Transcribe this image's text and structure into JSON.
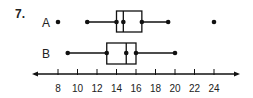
{
  "problem_number": "7.",
  "chart_data": {
    "type": "boxplot",
    "title": "",
    "xlabel": "",
    "ylabel": "",
    "orientation": "horizontal",
    "axis": {
      "min": 6,
      "max": 26.5,
      "ticks": [
        8,
        10,
        12,
        14,
        16,
        18,
        20,
        22,
        24
      ],
      "tick_labels": [
        "8",
        "10",
        "12",
        "14",
        "16",
        "18",
        "20",
        "22",
        "24"
      ],
      "arrows_both_ends": true
    },
    "series": [
      {
        "name": "A",
        "whisker_low": 11,
        "q1": 14,
        "median": 14.7,
        "q3": 16.6,
        "whisker_high": 19.3,
        "outliers": [
          8,
          24
        ]
      },
      {
        "name": "B",
        "whisker_low": 9,
        "q1": 13,
        "median": 15,
        "q3": 16,
        "whisker_high": 20,
        "outliers": []
      }
    ],
    "grid": false,
    "legend": "none"
  },
  "colors": {
    "ink": "#111111",
    "background": "#ffffff"
  }
}
